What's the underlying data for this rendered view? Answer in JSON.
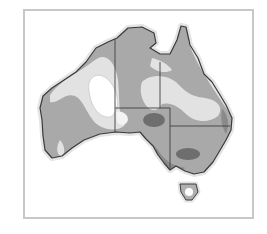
{
  "figure": {
    "style": "grayscale"
  },
  "colors": {
    "frame": "#c8c8c8",
    "halo": "#e4e4e4",
    "coast": "#3a3a3a",
    "zone_light": "#e2e2e2",
    "zone_white": "#ffffff",
    "zone_medium": "#a9a9a9",
    "zone_dark": "#6e6e6e",
    "border": "#404040"
  },
  "legend": []
}
